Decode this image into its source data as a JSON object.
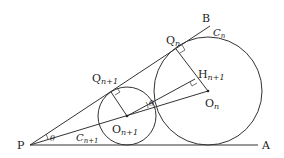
{
  "figure": {
    "points": {
      "P": {
        "label": "P",
        "x": 30,
        "y": 145
      },
      "A": {
        "label": "A",
        "x": 258,
        "y": 145
      },
      "B": {
        "label": "B",
        "x": 210,
        "y": 26
      },
      "On": {
        "label": "O",
        "sub": "n",
        "x": 208,
        "y": 91
      },
      "On1": {
        "label": "O",
        "sub": "n+1",
        "x": 127,
        "y": 116
      },
      "Qn": {
        "label": "Q",
        "sub": "n",
        "x": 176,
        "y": 49
      },
      "Qn1": {
        "label": "Q",
        "sub": "n+1",
        "x": 111,
        "y": 92
      },
      "Hn1": {
        "label": "H",
        "sub": "n+1",
        "x": 195,
        "y": 79
      }
    },
    "circles": {
      "Cn": {
        "label": "C",
        "sub": "n",
        "r": 54
      },
      "Cn1": {
        "label": "C",
        "sub": "n+1",
        "r": 29
      }
    },
    "angles": {
      "theta_P": "θ",
      "theta_mid": "θ"
    },
    "stroke_color": "#333333"
  }
}
